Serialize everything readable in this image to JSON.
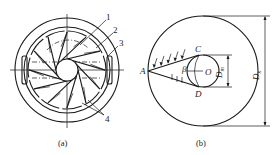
{
  "figure_a": {
    "caption": "(a)",
    "callouts": [
      "1",
      "2",
      "3",
      "4"
    ],
    "blade_count": 12
  },
  "figure_b": {
    "caption": "(b)",
    "points": {
      "A": "A",
      "C": "C",
      "D": "D",
      "O": "O"
    },
    "angle_label": "β",
    "inner_diameter_label": "D",
    "inner_diameter_sub": "m",
    "outer_diameter_label": "D",
    "outer_diameter_sub": "x"
  }
}
